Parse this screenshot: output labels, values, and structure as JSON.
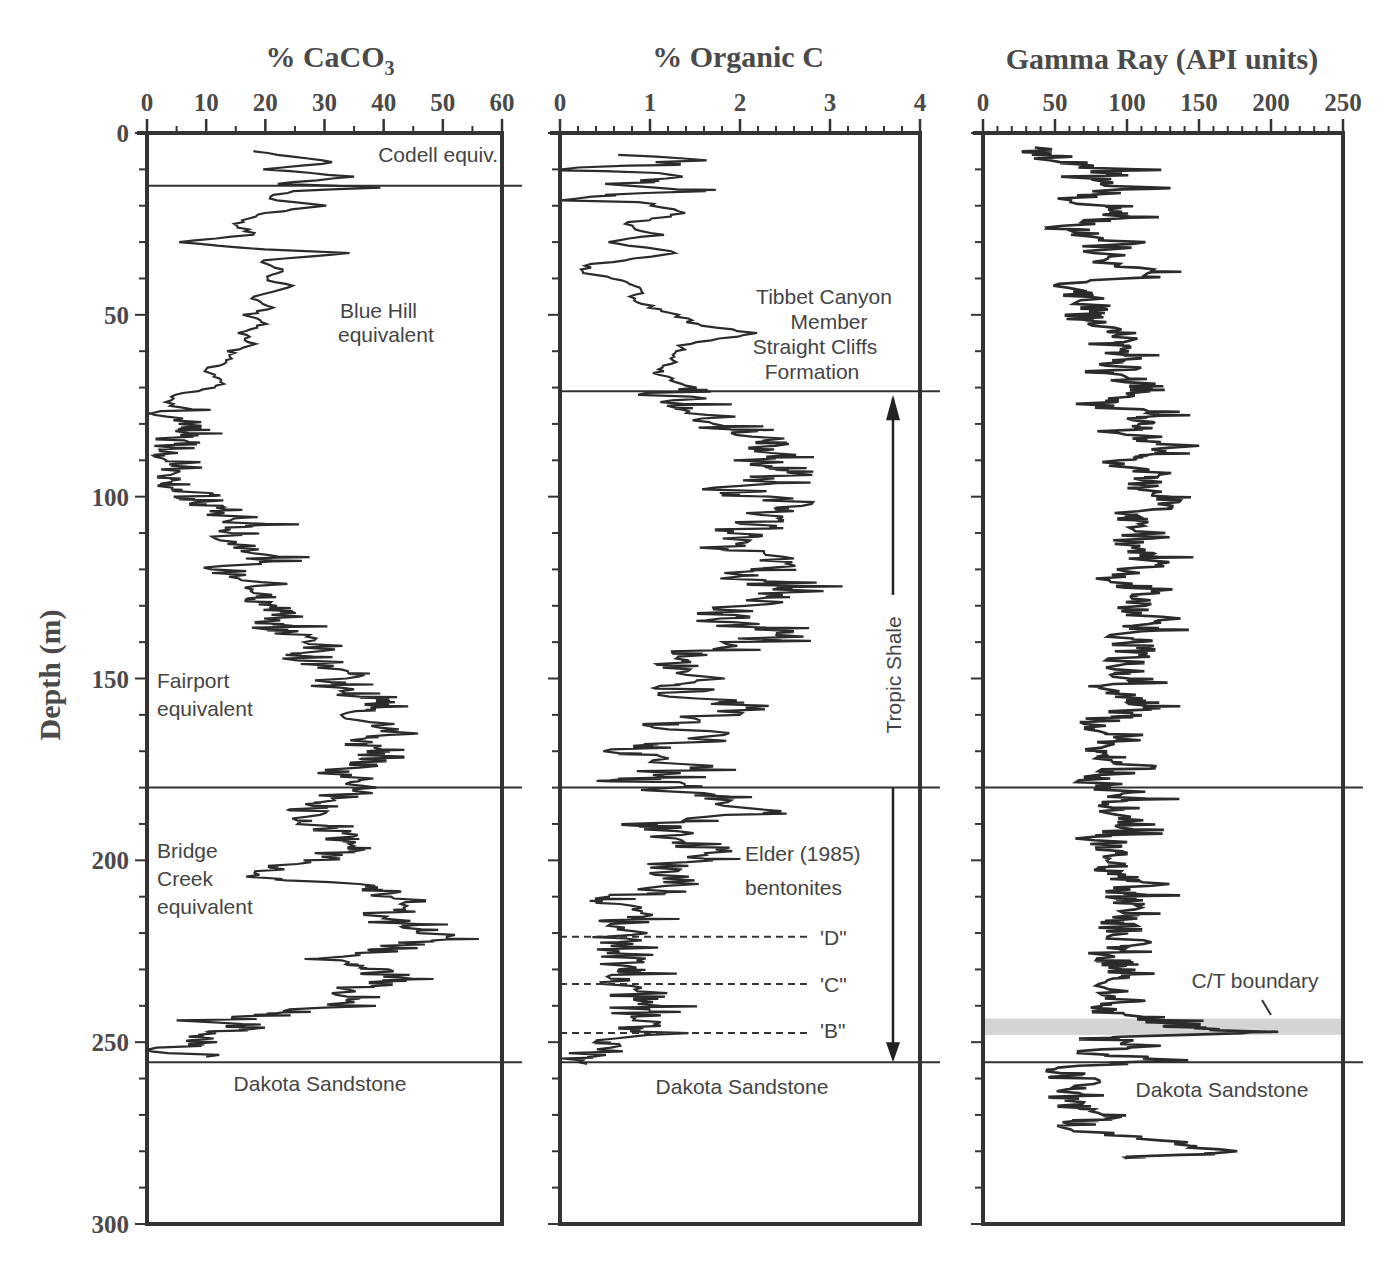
{
  "figure": {
    "partial_title": "",
    "depth_axis_label": "Depth (m)",
    "depth_ticks": [
      "0",
      "50",
      "100",
      "150",
      "200",
      "250",
      "300"
    ]
  },
  "panels": {
    "caco3": {
      "title": "% CaCO",
      "title_sub": "3",
      "ticks": [
        "0",
        "10",
        "20",
        "30",
        "40",
        "50",
        "60"
      ],
      "annotations": {
        "codell": "Codell equiv.",
        "blue_hill_1": "Blue  Hill",
        "blue_hill_2": "equivalent",
        "fairport_1": "Fairport",
        "fairport_2": "equivalent",
        "bridge_1": "Bridge",
        "bridge_2": "Creek",
        "bridge_3": "equivalent",
        "dakota": "Dakota Sandstone"
      }
    },
    "orgc": {
      "title": "% Organic C",
      "ticks": [
        "0",
        "1",
        "2",
        "3",
        "4"
      ],
      "annotations": {
        "tibbet_1": "Tibbet Canyon",
        "tibbet_2": "Member",
        "tibbet_3": "Straight Cliffs",
        "tibbet_4": "Formation",
        "tropic": "Tropic Shale",
        "elder_1": "Elder (1985)",
        "elder_2": "bentonites",
        "bent_d": "'D\"",
        "bent_c": "'C\"",
        "bent_b": "'B\"",
        "dakota": "Dakota Sandstone"
      }
    },
    "gamma": {
      "title": "Gamma Ray (API units)",
      "ticks": [
        "0",
        "50",
        "100",
        "150",
        "200",
        "250"
      ],
      "annotations": {
        "ct": "C/T boundary",
        "dakota": "Dakota Sandstone"
      }
    }
  },
  "chart_data": [
    {
      "type": "line",
      "title": "% CaCO3",
      "xlabel": "% CaCO3",
      "ylabel": "Depth (m)",
      "xlim": [
        0,
        60
      ],
      "ylim": [
        300,
        0
      ],
      "orientation": "vertical-log",
      "boundaries_depth_m": [
        14.5,
        180,
        255.5
      ],
      "units_labeled": [
        "Codell equiv.",
        "Blue Hill equivalent",
        "Fairport equivalent",
        "Bridge Creek equivalent",
        "Dakota Sandstone"
      ],
      "depth": [
        5,
        8,
        10,
        12,
        14,
        15,
        16,
        18,
        20,
        22,
        25,
        28,
        30,
        32,
        33,
        35,
        38,
        40,
        42,
        45,
        48,
        50,
        52,
        55,
        58,
        60,
        62,
        65,
        68,
        70,
        72,
        74,
        76,
        78,
        80,
        84,
        88,
        92,
        96,
        100,
        104,
        108,
        112,
        116,
        120,
        124,
        128,
        132,
        136,
        140,
        144,
        148,
        152,
        156,
        160,
        164,
        168,
        172,
        176,
        180,
        184,
        188,
        192,
        196,
        200,
        204,
        208,
        212,
        216,
        220,
        224,
        228,
        232,
        236,
        240,
        244,
        246,
        248,
        250,
        252,
        254
      ],
      "values": [
        18,
        32,
        20,
        35,
        22,
        40,
        24,
        20,
        30,
        20,
        15,
        18,
        5,
        20,
        35,
        19,
        23,
        20,
        24,
        18,
        21,
        17,
        20,
        16,
        18,
        14,
        15,
        10,
        13,
        12,
        5,
        4,
        4,
        5,
        6,
        5,
        5,
        6,
        5,
        8,
        12,
        17,
        14,
        22,
        12,
        20,
        18,
        26,
        20,
        30,
        26,
        34,
        30,
        40,
        34,
        44,
        36,
        40,
        33,
        38,
        30,
        25,
        32,
        35,
        28,
        18,
        40,
        45,
        38,
        50,
        42,
        30,
        44,
        32,
        35,
        8,
        18,
        5,
        12,
        3,
        10
      ]
    },
    {
      "type": "line",
      "title": "% Organic C",
      "xlabel": "% Organic C",
      "ylabel": "Depth (m)",
      "xlim": [
        0,
        4
      ],
      "ylim": [
        300,
        0
      ],
      "orientation": "vertical-log",
      "boundaries_depth_m": [
        71,
        180,
        255.5
      ],
      "bentonite_markers_m": {
        "D": 221,
        "C": 234,
        "B": 247.5
      },
      "units_labeled": [
        "Tibbet Canyon Member Straight Cliffs Formation",
        "Tropic Shale",
        "Dakota Sandstone"
      ],
      "depth": [
        6,
        8,
        10,
        12,
        14,
        16,
        18,
        20,
        22,
        25,
        28,
        30,
        33,
        36,
        38,
        40,
        43,
        46,
        50,
        53,
        55,
        58,
        62,
        66,
        70,
        72,
        74,
        78,
        82,
        86,
        90,
        94,
        98,
        102,
        106,
        110,
        114,
        118,
        122,
        126,
        130,
        134,
        138,
        142,
        146,
        150,
        154,
        158,
        162,
        166,
        170,
        174,
        178,
        182,
        186,
        190,
        194,
        198,
        202,
        206,
        210,
        214,
        218,
        222,
        226,
        230,
        234,
        238,
        242,
        246,
        248,
        250,
        252,
        254,
        256
      ],
      "values": [
        1.0,
        1.4,
        0.1,
        1.7,
        0.5,
        1.3,
        0.1,
        1.0,
        1.4,
        0.7,
        1.1,
        0.5,
        1.3,
        0.4,
        0.2,
        0.6,
        0.9,
        0.8,
        1.3,
        1.5,
        2.2,
        1.4,
        1.3,
        1.1,
        1.5,
        1.2,
        1.4,
        1.6,
        2.0,
        2.4,
        2.2,
        2.5,
        1.9,
        2.7,
        2.2,
        2.0,
        1.8,
        2.5,
        1.9,
        2.8,
        2.0,
        1.7,
        2.5,
        1.5,
        1.3,
        1.6,
        1.3,
        2.2,
        1.2,
        1.7,
        0.8,
        1.4,
        0.9,
        1.6,
        2.3,
        1.0,
        1.2,
        1.9,
        1.0,
        1.4,
        0.7,
        0.8,
        0.7,
        0.8,
        0.7,
        0.8,
        0.6,
        1.0,
        0.7,
        0.9,
        1.2,
        0.4,
        0.6,
        0.1,
        0.3
      ]
    },
    {
      "type": "line",
      "title": "Gamma Ray (API units)",
      "xlabel": "Gamma Ray (API units)",
      "ylabel": "Depth (m)",
      "xlim": [
        0,
        250
      ],
      "ylim": [
        300,
        0
      ],
      "orientation": "vertical-log",
      "boundaries_depth_m": [
        180,
        255.5
      ],
      "shaded_band_m": [
        243.5,
        248
      ],
      "shaded_band_label": "C/T boundary",
      "depth": [
        4,
        6,
        8,
        10,
        12,
        15,
        18,
        22,
        26,
        30,
        34,
        38,
        42,
        46,
        50,
        54,
        58,
        62,
        66,
        70,
        74,
        78,
        82,
        86,
        90,
        94,
        98,
        102,
        106,
        110,
        114,
        118,
        122,
        126,
        130,
        134,
        138,
        142,
        146,
        150,
        154,
        158,
        162,
        166,
        170,
        174,
        178,
        182,
        186,
        190,
        194,
        198,
        202,
        206,
        210,
        214,
        218,
        222,
        226,
        230,
        234,
        238,
        242,
        244,
        246,
        247,
        249,
        251,
        253,
        255,
        257,
        259,
        262,
        266,
        270,
        274,
        278,
        280,
        282
      ],
      "values": [
        35,
        45,
        50,
        90,
        70,
        105,
        60,
        95,
        55,
        100,
        75,
        120,
        55,
        80,
        70,
        95,
        90,
        105,
        85,
        110,
        75,
        115,
        95,
        135,
        90,
        120,
        100,
        130,
        95,
        110,
        100,
        115,
        90,
        120,
        100,
        125,
        95,
        110,
        100,
        105,
        90,
        110,
        80,
        100,
        85,
        105,
        75,
        100,
        95,
        110,
        80,
        100,
        85,
        115,
        95,
        110,
        90,
        105,
        80,
        95,
        90,
        100,
        85,
        120,
        150,
        200,
        80,
        110,
        70,
        130,
        50,
        60,
        70,
        55,
        85,
        60,
        150,
        160,
        100
      ]
    }
  ]
}
